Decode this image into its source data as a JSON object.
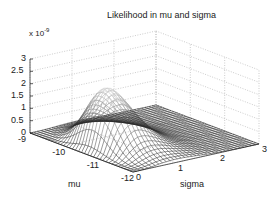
{
  "chart_data": {
    "type": "surface",
    "title": "Likelihood in mu and sigma",
    "xlabel": "mu",
    "ylabel": "sigma",
    "zlabel": "",
    "z_multiplier": "x 10^-9",
    "z_multiplier_base": "x 10",
    "z_multiplier_exp": "-9",
    "x_ticks": [
      "-9",
      "-10",
      "-11",
      "-12"
    ],
    "y_ticks": [
      "0",
      "1",
      "2",
      "3"
    ],
    "z_ticks": [
      "0",
      "0.5",
      "1",
      "1.5",
      "2",
      "2.5",
      "3"
    ],
    "xlim": [
      -12,
      -9
    ],
    "ylim": [
      0,
      3
    ],
    "zlim": [
      0,
      3e-09
    ],
    "grid": true,
    "colormap": "grayscale mesh",
    "peak": {
      "mu": -10.6,
      "sigma": 0.6,
      "z": 2.45e-09
    }
  }
}
